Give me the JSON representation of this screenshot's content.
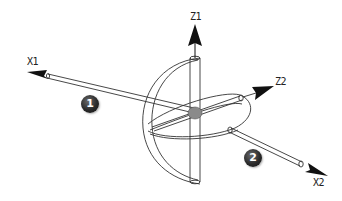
{
  "diagram": {
    "axes": [
      {
        "id": "x1",
        "label": "X1"
      },
      {
        "id": "z1",
        "label": "Z1"
      },
      {
        "id": "z2",
        "label": "Z2"
      },
      {
        "id": "x2",
        "label": "X2"
      }
    ],
    "badges": [
      {
        "id": "1",
        "label": "1"
      },
      {
        "id": "2",
        "label": "2"
      }
    ],
    "colors": {
      "line": "#333333",
      "arrow": "#111111",
      "center_joint": "#8a8a8a",
      "background": "#ffffff"
    }
  }
}
